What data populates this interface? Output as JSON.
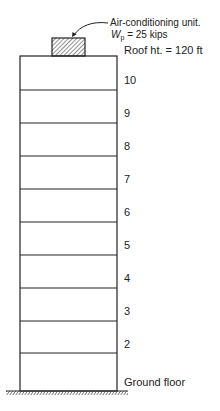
{
  "equipment": {
    "name": "Air-conditioning unit.",
    "weight_symbol": "W",
    "weight_subscript": "p",
    "weight_value": "= 25 kips",
    "weight_kips": 25
  },
  "roof": {
    "label": "Roof  ht. = 120  ft",
    "height_ft": 120
  },
  "floors": [
    {
      "label": "10",
      "y": 74
    },
    {
      "label": "9",
      "y": 107
    },
    {
      "label": "8",
      "y": 140
    },
    {
      "label": "7",
      "y": 173
    },
    {
      "label": "6",
      "y": 206
    },
    {
      "label": "5",
      "y": 239
    },
    {
      "label": "4",
      "y": 272
    },
    {
      "label": "3",
      "y": 305
    },
    {
      "label": "2",
      "y": 338
    },
    {
      "label": "Ground floor",
      "y": 376
    }
  ],
  "colors": {
    "line": "#222222",
    "background": "#ffffff"
  }
}
